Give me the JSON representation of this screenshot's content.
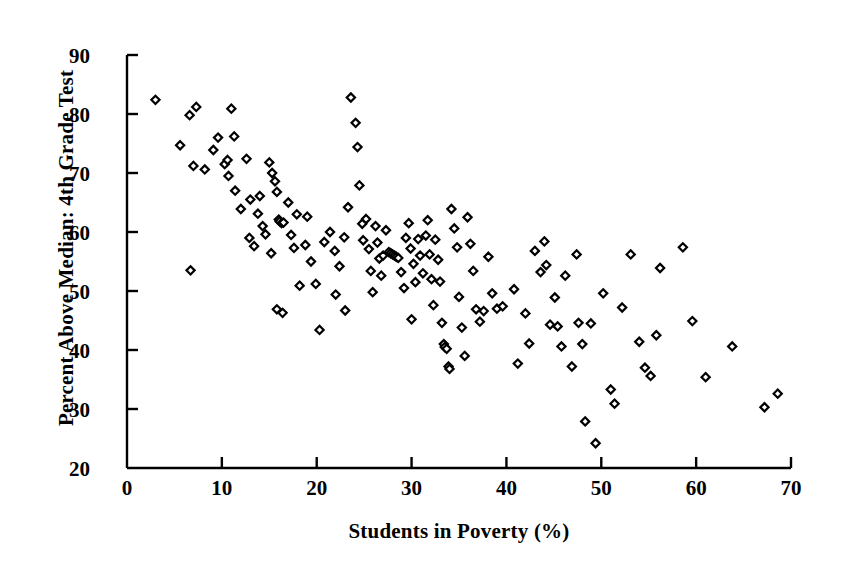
{
  "chart_data": {
    "type": "scatter",
    "title": "",
    "xlabel": "Students in Poverty (%)",
    "ylabel": "Percent Above Median: 4th Grade Test",
    "xlim": [
      0,
      70
    ],
    "ylim": [
      20,
      90
    ],
    "xticks": [
      0,
      10,
      20,
      30,
      40,
      50,
      60,
      70
    ],
    "yticks": [
      20,
      30,
      40,
      50,
      60,
      70,
      80,
      90
    ],
    "xtick_labels": [
      "0",
      "10",
      "20",
      "30",
      "40",
      "50",
      "60",
      "70"
    ],
    "ytick_labels": [
      "20",
      "30",
      "40",
      "50",
      "60",
      "70",
      "80",
      "90"
    ],
    "grid": false,
    "legend": null,
    "marker": "diamond-open",
    "marker_color": "#000000",
    "n_points": 152,
    "relationship": "negative correlation",
    "points": [
      [
        3.0,
        82.4
      ],
      [
        6.6,
        79.8
      ],
      [
        7.3,
        81.2
      ],
      [
        5.6,
        74.7
      ],
      [
        7.0,
        71.2
      ],
      [
        6.7,
        53.5
      ],
      [
        9.6,
        76.0
      ],
      [
        11.0,
        80.9
      ],
      [
        10.3,
        71.5
      ],
      [
        10.6,
        72.2
      ],
      [
        10.7,
        69.5
      ],
      [
        11.4,
        67.0
      ],
      [
        12.0,
        63.9
      ],
      [
        11.3,
        76.2
      ],
      [
        12.6,
        72.4
      ],
      [
        13.0,
        65.5
      ],
      [
        13.8,
        63.1
      ],
      [
        14.0,
        66.1
      ],
      [
        14.3,
        61.0
      ],
      [
        14.6,
        59.6
      ],
      [
        15.0,
        71.8
      ],
      [
        15.3,
        70.0
      ],
      [
        15.6,
        68.6
      ],
      [
        15.8,
        66.8
      ],
      [
        16.0,
        62.1
      ],
      [
        16.1,
        61.8
      ],
      [
        16.3,
        61.5
      ],
      [
        16.5,
        61.6
      ],
      [
        15.2,
        56.4
      ],
      [
        15.8,
        46.9
      ],
      [
        16.4,
        46.3
      ],
      [
        17.3,
        59.5
      ],
      [
        17.6,
        57.3
      ],
      [
        17.9,
        63.0
      ],
      [
        18.2,
        50.9
      ],
      [
        18.8,
        57.8
      ],
      [
        19.4,
        55.0
      ],
      [
        19.9,
        51.2
      ],
      [
        20.3,
        43.4
      ],
      [
        20.8,
        58.3
      ],
      [
        21.4,
        60.0
      ],
      [
        21.9,
        56.8
      ],
      [
        22.4,
        54.2
      ],
      [
        22.9,
        59.1
      ],
      [
        23.3,
        64.2
      ],
      [
        23.6,
        82.8
      ],
      [
        24.1,
        78.5
      ],
      [
        24.3,
        74.4
      ],
      [
        24.5,
        67.9
      ],
      [
        24.8,
        61.4
      ],
      [
        24.9,
        58.6
      ],
      [
        25.2,
        62.2
      ],
      [
        25.5,
        57.1
      ],
      [
        25.7,
        53.4
      ],
      [
        25.9,
        49.8
      ],
      [
        26.2,
        61.0
      ],
      [
        26.4,
        58.2
      ],
      [
        26.6,
        55.5
      ],
      [
        26.8,
        52.6
      ],
      [
        27.0,
        56.0
      ],
      [
        27.3,
        60.3
      ],
      [
        27.6,
        56.6
      ],
      [
        27.8,
        56.4
      ],
      [
        28.0,
        56.2
      ],
      [
        28.2,
        56.0
      ],
      [
        28.4,
        55.8
      ],
      [
        28.6,
        55.6
      ],
      [
        28.9,
        53.2
      ],
      [
        29.2,
        50.5
      ],
      [
        29.4,
        59.0
      ],
      [
        29.7,
        61.5
      ],
      [
        29.9,
        57.2
      ],
      [
        30.2,
        54.6
      ],
      [
        30.4,
        51.5
      ],
      [
        30.7,
        58.8
      ],
      [
        30.9,
        56.0
      ],
      [
        31.2,
        53.0
      ],
      [
        31.5,
        59.4
      ],
      [
        31.7,
        62.0
      ],
      [
        31.9,
        56.2
      ],
      [
        32.1,
        52.0
      ],
      [
        32.3,
        47.6
      ],
      [
        32.5,
        58.7
      ],
      [
        32.8,
        55.3
      ],
      [
        33.0,
        51.6
      ],
      [
        33.2,
        44.6
      ],
      [
        33.4,
        41.0
      ],
      [
        33.5,
        40.5
      ],
      [
        33.7,
        40.2
      ],
      [
        33.9,
        37.2
      ],
      [
        34.2,
        63.9
      ],
      [
        34.5,
        60.6
      ],
      [
        34.8,
        57.4
      ],
      [
        35.0,
        49.0
      ],
      [
        35.3,
        43.8
      ],
      [
        35.6,
        39.0
      ],
      [
        35.9,
        62.5
      ],
      [
        36.2,
        58.0
      ],
      [
        36.5,
        53.4
      ],
      [
        36.8,
        46.9
      ],
      [
        37.2,
        44.8
      ],
      [
        37.6,
        46.6
      ],
      [
        38.1,
        55.8
      ],
      [
        38.5,
        49.6
      ],
      [
        39.0,
        47.0
      ],
      [
        40.8,
        50.3
      ],
      [
        41.2,
        37.7
      ],
      [
        42.4,
        41.1
      ],
      [
        43.0,
        56.8
      ],
      [
        43.6,
        53.2
      ],
      [
        44.0,
        58.4
      ],
      [
        44.2,
        54.4
      ],
      [
        44.6,
        44.3
      ],
      [
        45.1,
        48.9
      ],
      [
        45.4,
        44.0
      ],
      [
        45.8,
        40.6
      ],
      [
        46.2,
        52.6
      ],
      [
        46.9,
        37.2
      ],
      [
        47.4,
        56.2
      ],
      [
        47.6,
        44.6
      ],
      [
        48.0,
        41.0
      ],
      [
        48.3,
        27.9
      ],
      [
        48.9,
        44.5
      ],
      [
        49.4,
        24.2
      ],
      [
        50.2,
        49.6
      ],
      [
        51.0,
        33.3
      ],
      [
        51.4,
        30.9
      ],
      [
        52.2,
        47.2
      ],
      [
        53.1,
        56.2
      ],
      [
        54.0,
        41.4
      ],
      [
        54.6,
        37.0
      ],
      [
        55.2,
        35.6
      ],
      [
        55.8,
        42.5
      ],
      [
        56.2,
        53.9
      ],
      [
        58.6,
        57.4
      ],
      [
        59.6,
        44.9
      ],
      [
        61.0,
        35.4
      ],
      [
        63.8,
        40.6
      ],
      [
        67.2,
        30.3
      ],
      [
        68.6,
        32.6
      ],
      [
        8.2,
        70.6
      ],
      [
        9.1,
        73.9
      ],
      [
        12.9,
        59.0
      ],
      [
        13.4,
        57.6
      ],
      [
        17.0,
        65.0
      ],
      [
        19.0,
        62.6
      ],
      [
        22.0,
        49.4
      ],
      [
        23.0,
        46.7
      ],
      [
        30.0,
        45.2
      ],
      [
        34.0,
        36.8
      ],
      [
        39.6,
        47.4
      ],
      [
        42.0,
        46.2
      ]
    ]
  },
  "axes": {
    "plot_left_px": 127,
    "plot_right_px": 791,
    "plot_top_px": 55,
    "plot_bottom_px": 468
  }
}
